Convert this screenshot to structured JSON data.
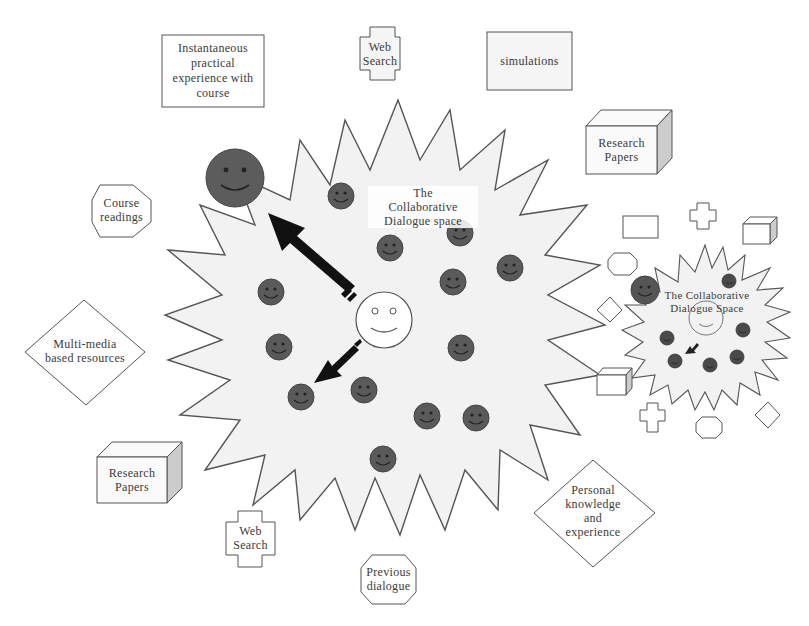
{
  "diagram": {
    "main_space": {
      "label_lines": [
        "The",
        "Collaborative",
        "Dialogue space"
      ],
      "fill": "#f2f2f2",
      "stroke": "#555555"
    },
    "mini_space": {
      "label_lines": [
        "The Collaborative",
        "Dialogue Space"
      ]
    },
    "resources": [
      {
        "id": "instantaneous",
        "shape": "rectangle",
        "lines": [
          "Instantaneous",
          "practical",
          "experience with",
          "course"
        ]
      },
      {
        "id": "web-search-top",
        "shape": "cross",
        "lines": [
          "Web",
          "Search"
        ]
      },
      {
        "id": "simulations",
        "shape": "rectangle",
        "lines": [
          "simulations"
        ]
      },
      {
        "id": "research-papers-top",
        "shape": "cube",
        "lines": [
          "Research",
          "Papers"
        ]
      },
      {
        "id": "course-readings",
        "shape": "octagon",
        "lines": [
          "Course",
          "readings"
        ]
      },
      {
        "id": "multimedia",
        "shape": "diamond",
        "lines": [
          "Multi-media",
          "based resources"
        ]
      },
      {
        "id": "research-papers-bottom",
        "shape": "cube",
        "lines": [
          "Research",
          "Papers"
        ]
      },
      {
        "id": "web-search-bottom",
        "shape": "cross",
        "lines": [
          "Web",
          "Search"
        ]
      },
      {
        "id": "previous-dialogue",
        "shape": "octagon",
        "lines": [
          "Previous",
          "dialogue"
        ]
      },
      {
        "id": "personal-knowledge",
        "shape": "diamond",
        "lines": [
          "Personal",
          "knowledge",
          "and",
          "experience"
        ]
      }
    ],
    "colors": {
      "participant": "#555555",
      "learner": "#ffffff",
      "arrow": "#111111",
      "outline": "#555555",
      "cube_side": "#cccccc"
    }
  }
}
